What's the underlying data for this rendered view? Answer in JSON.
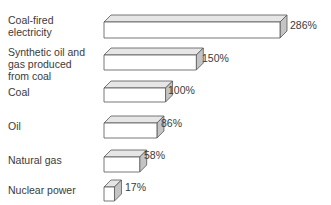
{
  "chart_data": {
    "type": "bar",
    "orientation": "horizontal",
    "style": "3d-box",
    "title": "",
    "xlabel": "",
    "ylabel": "",
    "categories": [
      "Coal-fired electricity",
      "Synthetic oil and gas produced from coal",
      "Coal",
      "Oil",
      "Natural gas",
      "Nuclear power"
    ],
    "values": [
      286,
      150,
      100,
      86,
      58,
      17
    ],
    "value_labels": [
      "286%",
      "150%",
      "100%",
      "86%",
      "58%",
      "17%"
    ],
    "unit": "%",
    "grid": false,
    "legend": null
  },
  "labels": [
    {
      "lines": [
        "Coal-fired",
        "electricity"
      ]
    },
    {
      "lines": [
        "Synthetic oil and",
        "gas produced",
        "from coal"
      ]
    },
    {
      "lines": [
        "Coal"
      ]
    },
    {
      "lines": [
        "Oil"
      ]
    },
    {
      "lines": [
        "Natural gas"
      ]
    },
    {
      "lines": [
        "Nuclear power"
      ]
    }
  ],
  "colors": {
    "front": "#ffffff",
    "top": "#e6e6e6",
    "side": "#c4c4c4",
    "stroke": "#555555",
    "text": "#3a3a3a"
  }
}
